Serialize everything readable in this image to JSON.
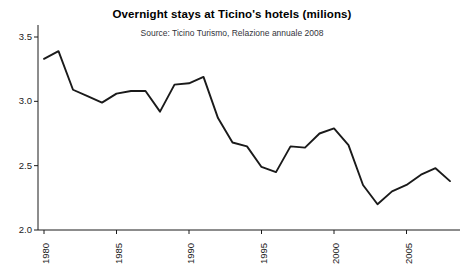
{
  "chart_data": {
    "type": "line",
    "title": "Overnight stays at Ticino's hotels (milions)",
    "subtitle": "Source: Ticino Turismo, Relazione annuale 2008",
    "xlabel": "",
    "ylabel": "",
    "grid": false,
    "legend": "none",
    "line_color": "#1a1a1a",
    "axis_color": "#1a1a1a",
    "xlim": [
      1980,
      2008
    ],
    "ylim": [
      2.0,
      3.5
    ],
    "y_ticks": [
      "3.5",
      "3.0",
      "2.5",
      "2.0"
    ],
    "y_tick_values": [
      3.5,
      3.0,
      2.5,
      2.0
    ],
    "x_ticks": [
      "1980",
      "1985",
      "1990",
      "1995",
      "2000",
      "2005"
    ],
    "x_tick_values": [
      1980,
      1985,
      1990,
      1995,
      2000,
      2005
    ],
    "x": [
      1980,
      1981,
      1982,
      1983,
      1984,
      1985,
      1986,
      1987,
      1988,
      1989,
      1990,
      1991,
      1992,
      1993,
      1994,
      1995,
      1996,
      1997,
      1998,
      1999,
      2000,
      2001,
      2002,
      2003,
      2004,
      2005,
      2006,
      2007,
      2008
    ],
    "values": [
      3.33,
      3.39,
      3.09,
      3.04,
      2.99,
      3.06,
      3.08,
      3.08,
      2.92,
      3.13,
      3.14,
      3.19,
      2.87,
      2.68,
      2.65,
      2.49,
      2.45,
      2.65,
      2.64,
      2.75,
      2.79,
      2.66,
      2.35,
      2.2,
      2.3,
      2.35,
      2.43,
      2.48,
      2.38
    ],
    "series": [
      {
        "name": "Overnight stays",
        "values": [
          3.33,
          3.39,
          3.09,
          3.04,
          2.99,
          3.06,
          3.08,
          3.08,
          2.92,
          3.13,
          3.14,
          3.19,
          2.87,
          2.68,
          2.65,
          2.49,
          2.45,
          2.65,
          2.64,
          2.75,
          2.79,
          2.66,
          2.35,
          2.2,
          2.3,
          2.35,
          2.43,
          2.48,
          2.38
        ]
      }
    ]
  }
}
